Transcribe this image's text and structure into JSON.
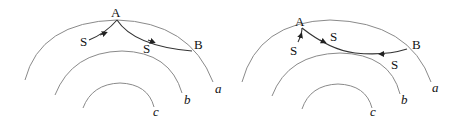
{
  "diagrams": [
    {
      "id": "left",
      "point_a": "A",
      "point_b": "B",
      "s_labels": [
        "S",
        "S"
      ],
      "arc_labels": [
        "a",
        "b",
        "c"
      ]
    },
    {
      "id": "right",
      "point_a": "A",
      "point_b": "B",
      "s_labels": [
        "S",
        "S",
        "S"
      ],
      "arc_labels": [
        "a",
        "b",
        "c"
      ]
    }
  ],
  "colors": {
    "arc": "#8a8a8a",
    "path": "#333333",
    "text": "#111111"
  }
}
